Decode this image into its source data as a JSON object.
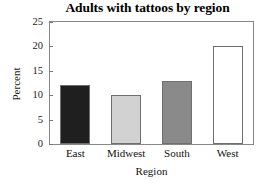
{
  "chart_data": {
    "type": "bar",
    "title": "Adults with tattoos by region",
    "xlabel": "Region",
    "ylabel": "Percent",
    "categories": [
      "East",
      "Midwest",
      "South",
      "West"
    ],
    "values": [
      12,
      10,
      13,
      20
    ],
    "bar_colors": [
      "#1f1f1f",
      "#d2d2d2",
      "#8a8a8a",
      "#ffffff"
    ],
    "bar_border_color": "#6f6f6f",
    "ylim": [
      0,
      25
    ],
    "ytick_labels": [
      "0",
      "5",
      "10",
      "15",
      "20",
      "25"
    ],
    "ytick_values": [
      0,
      5,
      10,
      15,
      20,
      25
    ],
    "grid": false,
    "legend": "none",
    "frame_color": "#888888",
    "background": "#ffffff"
  }
}
